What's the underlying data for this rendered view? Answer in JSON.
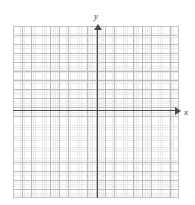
{
  "figure": {
    "type": "blank-cartesian-grid",
    "background_color": "#ffffff",
    "clipped_header_fragments": [
      "",
      "",
      ""
    ]
  },
  "axes": {
    "x": {
      "label": "x",
      "label_style": "italic",
      "arrow": "right",
      "color": "#4a4a4a",
      "origin_pixel_y": 110,
      "start_pixel_x": 13,
      "end_pixel_x": 177
    },
    "y": {
      "label": "y",
      "label_style": "italic",
      "arrow": "up",
      "color": "#4a4a4a",
      "origin_pixel_x": 97,
      "start_pixel_y": 198,
      "end_pixel_y": 28
    }
  },
  "grid": {
    "visible": true,
    "major": {
      "color": "#bcbcbc",
      "x_spacing_px": 9.22,
      "y_spacing_px": 9.05,
      "columns": 18,
      "rows": 19
    },
    "minor": {
      "color": "#d8d8d8",
      "style": "dotted",
      "x_spacing_px": 1.84,
      "y_spacing_px": 1.84
    },
    "bounds_px": {
      "left": 13,
      "top": 26,
      "width": 166,
      "height": 172
    },
    "border_color": "#c2c2c2"
  },
  "chart_data": {
    "type": "scatter",
    "title": "",
    "xlabel": "x",
    "ylabel": "y",
    "series": [
      {
        "name": "",
        "x": [],
        "y": []
      }
    ],
    "x": [],
    "values": [],
    "categories": [],
    "xlim": [
      -9,
      9
    ],
    "ylim": [
      -9.7,
      9.3
    ],
    "grid": true,
    "legend": "none",
    "annotations": [],
    "note": "Empty coordinate plane — no data plotted; blank grid for graphing."
  }
}
